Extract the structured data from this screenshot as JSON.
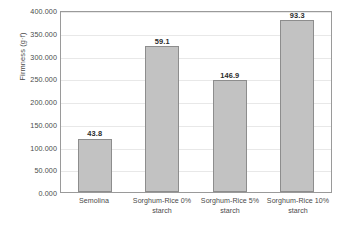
{
  "chart_data": {
    "type": "bar",
    "title": "",
    "xlabel": "",
    "ylabel": "Firmness (g·f)",
    "categories": [
      "Semolina",
      "Sorghum-Rice 0% starch",
      "Sorghum-Rice 5% starch",
      "Sorghum-Rice 10% starch"
    ],
    "values": [
      117.0,
      320.5,
      245.5,
      377.5
    ],
    "data_labels": [
      "43.8",
      "59.1",
      "146.9",
      "93.3"
    ],
    "ylim": [
      0,
      400
    ],
    "ytick_step": 50,
    "ytick_labels": [
      "400.000",
      "350.000",
      "300.000",
      "250.000",
      "200.000",
      "150.000",
      "100.000",
      "50.000",
      "0.000"
    ],
    "grid": true,
    "legend": "none",
    "colors": {
      "bar_fill": "#c2c2c2",
      "bar_border": "#8d8d8d",
      "gridline": "#e8e8e8",
      "axis": "#9a9a9a",
      "text": "#4a4a4a",
      "label_text": "#2b2b2b",
      "background": "#ffffff"
    }
  }
}
